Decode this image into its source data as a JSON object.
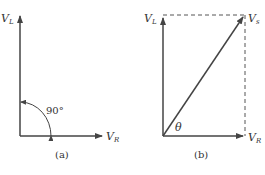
{
  "diagram_a": {
    "caption": "(a)",
    "vertical_label": "V",
    "vertical_sub": "L",
    "horizontal_label": "V",
    "horizontal_sub": "R",
    "angle_label": "90°"
  },
  "diagram_b": {
    "caption": "(b)",
    "vertical_label": "V",
    "vertical_sub": "L",
    "horizontal_label": "V",
    "horizontal_sub": "R",
    "resultant_label": "V",
    "resultant_sub": "s",
    "angle_label": "θ"
  },
  "colors": {
    "line": "#444444",
    "text": "#333333"
  }
}
